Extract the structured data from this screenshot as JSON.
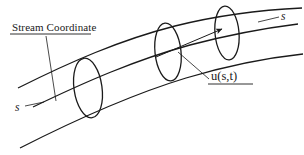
{
  "figure": {
    "title_caption": "",
    "background_color": "#ffffff",
    "stroke_color": "#1a1a1a",
    "width": 304,
    "height": 155
  },
  "labels": {
    "stream_coordinate": "Stream Coordinate",
    "velocity": "u(s,t)",
    "s_right": "s",
    "s_left": "s"
  },
  "diagram_data": {
    "type": "schematic",
    "subject": "curved stream tube with stream coordinate s and velocity u(s,t)",
    "curves": [
      {
        "name": "tube-top-boundary",
        "path": "M 18,88 C 70,62 120,40 175,26 C 215,16 260,10 302,8"
      },
      {
        "name": "tube-centerline",
        "path": "M 33,107 C 85,82 135,60 190,45 C 228,35 266,28 298,24"
      },
      {
        "name": "tube-bottom-boundary",
        "path": "M 20,148 C 75,120 130,95 186,78 C 226,66 266,58 303,54"
      }
    ],
    "cross_sections": [
      {
        "name": "cross-section-1",
        "cx": 88,
        "cy": 88,
        "rx": 14,
        "ry": 30,
        "rotation": -8
      },
      {
        "name": "cross-section-2",
        "cx": 168,
        "cy": 52,
        "rx": 13,
        "ry": 29,
        "rotation": -6
      },
      {
        "name": "cross-section-3",
        "cx": 227,
        "cy": 33,
        "rx": 12,
        "ry": 27,
        "rotation": -5
      }
    ],
    "velocity_arrow": {
      "name": "velocity-vector-arrow",
      "from": [
        156,
        57
      ],
      "to": [
        222,
        29
      ]
    },
    "leader_lines": [
      {
        "name": "stream-coordinate-leader",
        "from": [
          46,
          36
        ],
        "to": [
          56,
          101
        ]
      },
      {
        "name": "velocity-leader",
        "from": [
          209,
          79
        ],
        "to": [
          178,
          52
        ]
      },
      {
        "name": "s-left-leader",
        "from": [
          25,
          106
        ],
        "to": [
          44,
          102
        ]
      },
      {
        "name": "s-right-leader",
        "from": [
          279,
          17
        ],
        "to": [
          258,
          22
        ]
      }
    ],
    "underlines": [
      {
        "name": "stream-coordinate-underline",
        "x1": 10,
        "y1": 34,
        "x2": 91,
        "y2": 34
      },
      {
        "name": "velocity-underline",
        "x1": 208,
        "y1": 84,
        "x2": 253,
        "y2": 84
      }
    ]
  }
}
